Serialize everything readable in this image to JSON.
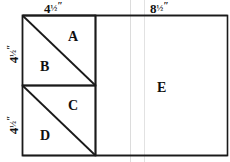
{
  "diagram": {
    "dimension_labels": {
      "top_left": {
        "whole": "4",
        "fraction": "½",
        "unit": "″"
      },
      "top_right": {
        "whole": "8",
        "fraction": "½",
        "unit": "″"
      },
      "left_upper": {
        "whole": "4",
        "fraction": "½",
        "unit": "″"
      },
      "left_lower": {
        "whole": "4",
        "fraction": "½",
        "unit": "″"
      }
    },
    "regions": [
      {
        "id": "A",
        "label": "A",
        "shape": "triangle",
        "position": "upper-square-top-right"
      },
      {
        "id": "B",
        "label": "B",
        "shape": "triangle",
        "position": "upper-square-bottom-left"
      },
      {
        "id": "C",
        "label": "C",
        "shape": "triangle",
        "position": "lower-square-top-right"
      },
      {
        "id": "D",
        "label": "D",
        "shape": "triangle",
        "position": "lower-square-bottom-left"
      },
      {
        "id": "E",
        "label": "E",
        "shape": "rectangle",
        "position": "right-panel"
      }
    ],
    "colors": {
      "stroke": "#1a1a1a",
      "faint_guide": "#d8d8d8",
      "background": "#ffffff",
      "text": "#101010"
    }
  }
}
